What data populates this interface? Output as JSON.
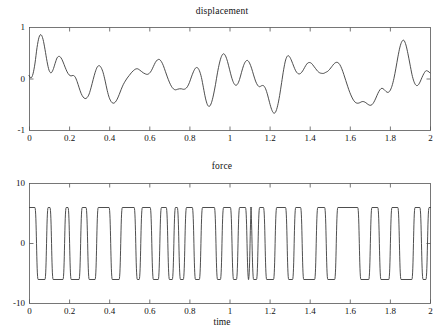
{
  "figure": {
    "width": 444,
    "height": 336,
    "background": "#ffffff",
    "line_color": "#3a3a3a",
    "axis_color": "#555555"
  },
  "panels": [
    {
      "name": "displacement",
      "title": "displacement",
      "xlabel": "",
      "ylabel": "",
      "x_ticks": [
        "0",
        "0.2",
        "0.4",
        "0.6",
        "0.8",
        "1",
        "1.2",
        "1.4",
        "1.6",
        "1.8",
        "2"
      ],
      "y_ticks": [
        "1",
        "0",
        "-1"
      ],
      "plot_box": {
        "left": 29,
        "top": 27,
        "right": 430,
        "bottom": 130
      }
    },
    {
      "name": "force",
      "title": "force",
      "xlabel": "time",
      "ylabel": "",
      "x_ticks": [
        "0",
        "0.2",
        "0.4",
        "0.6",
        "0.8",
        "1",
        "1.2",
        "1.4",
        "1.6",
        "1.8",
        "2"
      ],
      "y_ticks": [
        "10",
        "0",
        "-10"
      ],
      "plot_box": {
        "left": 29,
        "top": 183,
        "right": 430,
        "bottom": 303
      }
    }
  ],
  "chart_data": [
    {
      "type": "line",
      "title": "displacement",
      "xlabel": "",
      "ylabel": "displacement",
      "xlim": [
        0,
        2
      ],
      "ylim": [
        -1,
        1
      ],
      "xticks": [
        0,
        0.2,
        0.4,
        0.6,
        0.8,
        1,
        1.2,
        1.4,
        1.6,
        1.8,
        2
      ],
      "yticks": [
        -1,
        0,
        1
      ],
      "grid": false,
      "legend": "none",
      "series": [
        {
          "name": "displacement",
          "x": [
            0.0,
            0.01,
            0.02,
            0.03,
            0.04,
            0.05,
            0.06,
            0.07,
            0.08,
            0.09,
            0.1,
            0.11,
            0.12,
            0.13,
            0.14,
            0.15,
            0.16,
            0.17,
            0.18,
            0.19,
            0.2,
            0.21,
            0.22,
            0.23,
            0.24,
            0.25,
            0.26,
            0.27,
            0.28,
            0.29,
            0.3,
            0.31,
            0.32,
            0.33,
            0.34,
            0.35,
            0.36,
            0.37,
            0.38,
            0.39,
            0.4,
            0.41,
            0.42,
            0.43,
            0.44,
            0.45,
            0.46,
            0.47,
            0.48,
            0.49,
            0.5,
            0.51,
            0.52,
            0.53,
            0.54,
            0.55,
            0.56,
            0.57,
            0.58,
            0.59,
            0.6,
            0.61,
            0.62,
            0.63,
            0.64,
            0.65,
            0.66,
            0.67,
            0.68,
            0.69,
            0.7,
            0.71,
            0.72,
            0.73,
            0.74,
            0.75,
            0.76,
            0.77,
            0.78,
            0.79,
            0.8,
            0.81,
            0.82,
            0.83,
            0.84,
            0.85,
            0.86,
            0.87,
            0.88,
            0.89,
            0.9,
            0.91,
            0.92,
            0.93,
            0.94,
            0.95,
            0.96,
            0.97,
            0.98,
            0.99,
            1.0,
            1.01,
            1.02,
            1.03,
            1.04,
            1.05,
            1.06,
            1.07,
            1.08,
            1.09,
            1.1,
            1.11,
            1.12,
            1.13,
            1.14,
            1.15,
            1.16,
            1.17,
            1.18,
            1.19,
            1.2,
            1.21,
            1.22,
            1.23,
            1.24,
            1.25,
            1.26,
            1.27,
            1.28,
            1.29,
            1.3,
            1.31,
            1.32,
            1.33,
            1.34,
            1.35,
            1.36,
            1.37,
            1.38,
            1.39,
            1.4,
            1.41,
            1.42,
            1.43,
            1.44,
            1.45,
            1.46,
            1.47,
            1.48,
            1.49,
            1.5,
            1.51,
            1.52,
            1.53,
            1.54,
            1.55,
            1.56,
            1.57,
            1.58,
            1.59,
            1.6,
            1.61,
            1.62,
            1.63,
            1.64,
            1.65,
            1.66,
            1.67,
            1.68,
            1.69,
            1.7,
            1.71,
            1.72,
            1.73,
            1.74,
            1.75,
            1.76,
            1.77,
            1.78,
            1.79,
            1.8,
            1.81,
            1.82,
            1.83,
            1.84,
            1.85,
            1.86,
            1.87,
            1.88,
            1.89,
            1.9,
            1.91,
            1.92,
            1.93,
            1.94,
            1.95,
            1.96,
            1.97,
            1.98,
            1.99,
            2.0
          ],
          "y": [
            0.06,
            0.01,
            0.09,
            0.3,
            0.6,
            0.8,
            0.85,
            0.76,
            0.56,
            0.33,
            0.16,
            0.11,
            0.17,
            0.29,
            0.4,
            0.43,
            0.4,
            0.32,
            0.22,
            0.13,
            0.07,
            0.05,
            0.06,
            0.03,
            -0.06,
            -0.18,
            -0.29,
            -0.36,
            -0.39,
            -0.37,
            -0.3,
            -0.17,
            -0.02,
            0.12,
            0.22,
            0.25,
            0.21,
            0.11,
            -0.05,
            -0.23,
            -0.37,
            -0.45,
            -0.48,
            -0.46,
            -0.4,
            -0.31,
            -0.21,
            -0.12,
            -0.05,
            0.01,
            0.06,
            0.11,
            0.15,
            0.18,
            0.19,
            0.17,
            0.14,
            0.11,
            0.09,
            0.08,
            0.1,
            0.15,
            0.23,
            0.31,
            0.36,
            0.37,
            0.33,
            0.25,
            0.14,
            0.03,
            -0.07,
            -0.15,
            -0.2,
            -0.22,
            -0.21,
            -0.2,
            -0.2,
            -0.21,
            -0.2,
            -0.16,
            -0.08,
            0.03,
            0.13,
            0.2,
            0.21,
            0.15,
            0.02,
            -0.18,
            -0.38,
            -0.51,
            -0.54,
            -0.47,
            -0.32,
            -0.12,
            0.11,
            0.3,
            0.43,
            0.48,
            0.44,
            0.33,
            0.18,
            0.03,
            -0.08,
            -0.13,
            -0.11,
            -0.02,
            0.12,
            0.25,
            0.33,
            0.35,
            0.3,
            0.2,
            0.07,
            -0.05,
            -0.13,
            -0.16,
            -0.14,
            -0.14,
            -0.2,
            -0.32,
            -0.47,
            -0.6,
            -0.67,
            -0.65,
            -0.53,
            -0.33,
            -0.08,
            0.17,
            0.36,
            0.44,
            0.42,
            0.34,
            0.24,
            0.15,
            0.1,
            0.09,
            0.12,
            0.18,
            0.25,
            0.3,
            0.31,
            0.29,
            0.24,
            0.19,
            0.14,
            0.11,
            0.1,
            0.1,
            0.12,
            0.14,
            0.18,
            0.23,
            0.28,
            0.31,
            0.31,
            0.27,
            0.19,
            0.08,
            -0.04,
            -0.16,
            -0.27,
            -0.36,
            -0.43,
            -0.47,
            -0.48,
            -0.47,
            -0.45,
            -0.45,
            -0.47,
            -0.5,
            -0.52,
            -0.51,
            -0.46,
            -0.38,
            -0.29,
            -0.22,
            -0.19,
            -0.21,
            -0.25,
            -0.27,
            -0.24,
            -0.15,
            0.0,
            0.2,
            0.42,
            0.61,
            0.72,
            0.74,
            0.65,
            0.48,
            0.28,
            0.08,
            -0.06,
            -0.13,
            -0.13,
            -0.07,
            0.02,
            0.1,
            0.15,
            0.14,
            0.11,
            0.08,
            0.09
          ]
        }
      ]
    },
    {
      "type": "line",
      "title": "force",
      "xlabel": "time",
      "ylabel": "force",
      "xlim": [
        0,
        2
      ],
      "ylim": [
        -10,
        10
      ],
      "xticks": [
        0,
        0.2,
        0.4,
        0.6,
        0.8,
        1,
        1.2,
        1.4,
        1.6,
        1.8,
        2
      ],
      "yticks": [
        -10,
        0,
        10
      ],
      "grid": false,
      "legend": "none",
      "description": "rounded square wave alternating between about +6 and -6 with irregular switching times",
      "series": [
        {
          "name": "force",
          "high_level": 6,
          "low_level": -6,
          "transitions": [
            0.0,
            0.035,
            0.085,
            0.11,
            0.175,
            0.2,
            0.255,
            0.29,
            0.335,
            0.405,
            0.455,
            0.53,
            0.555,
            0.61,
            0.65,
            0.69,
            0.72,
            0.745,
            0.775,
            0.82,
            0.855,
            0.93,
            0.96,
            1.01,
            1.04,
            1.085,
            1.1,
            1.11,
            1.14,
            1.175,
            1.225,
            1.285,
            1.32,
            1.36,
            1.43,
            1.48,
            1.53,
            1.645,
            1.7,
            1.745,
            1.8,
            1.845,
            1.915,
            1.955,
            1.985
          ],
          "start_level": 6
        }
      ]
    }
  ]
}
